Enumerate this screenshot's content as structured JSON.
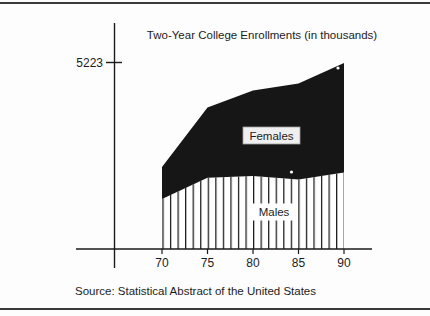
{
  "figure": {
    "title": "Two-Year College Enrollments (in thousands)",
    "source": "Source: Statistical Abstract of the United States",
    "y_axis_tick_label": "5223",
    "area_labels": {
      "females": "Females",
      "males": "Males"
    }
  },
  "chart_data": {
    "type": "area",
    "stacked": true,
    "title": "Two-Year College Enrollments (in thousands)",
    "x": [
      70,
      75,
      80,
      85,
      90
    ],
    "x_tick_labels": [
      "70",
      "75",
      "80",
      "85",
      "90"
    ],
    "xlabel": "",
    "ylabel": "",
    "y_axis_ticks": [
      5223
    ],
    "ylim": [
      0,
      5600
    ],
    "grid": false,
    "legend": "labels placed inside areas",
    "series": [
      {
        "name": "Males",
        "fill": "vertical-hatch",
        "values": [
          1400,
          2000,
          2050,
          1950,
          2150
        ]
      },
      {
        "name": "Females",
        "fill": "solid-black",
        "values": [
          900,
          1970,
          2400,
          2700,
          3073
        ]
      }
    ],
    "stacked_totals": [
      2300,
      3970,
      4450,
      4650,
      5223
    ],
    "source": "Source: Statistical Abstract of the United States",
    "colors": {
      "females_fill": "#161616",
      "hatch_line": "#1a1a1a",
      "background": "#ffffff"
    }
  }
}
